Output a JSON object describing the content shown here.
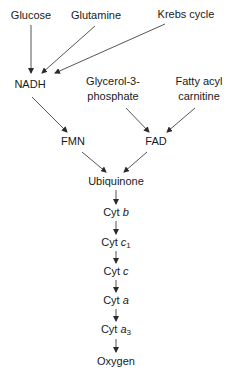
{
  "diagram": {
    "type": "flowchart",
    "title": "",
    "colors": {
      "line": "#2a2a2a",
      "text": "#1a1a1a",
      "background": "#ffffff"
    },
    "nodes": {
      "glucose": {
        "label": "Glucose"
      },
      "glutamine": {
        "label": "Glutamine"
      },
      "krebs": {
        "label": "Krebs cycle"
      },
      "nadh": {
        "label": "NADH"
      },
      "glycerol": {
        "line1": "Glycerol-3-",
        "line2": "phosphate"
      },
      "fatty": {
        "line1": "Fatty acyl",
        "line2": "carnitine"
      },
      "fmn": {
        "label": "FMN"
      },
      "fad": {
        "label": "FAD"
      },
      "ubiquinone": {
        "label": "Ubiquinone"
      },
      "cytb": {
        "prefix": "Cyt ",
        "letter": "b"
      },
      "cytc1": {
        "prefix": "Cyt ",
        "letter": "c",
        "sub": "1"
      },
      "cytc": {
        "prefix": "Cyt ",
        "letter": "c"
      },
      "cyta": {
        "prefix": "Cyt ",
        "letter": "a"
      },
      "cyta3": {
        "prefix": "Cyt ",
        "letter": "a",
        "sub": "3"
      },
      "oxygen": {
        "label": "Oxygen"
      }
    },
    "edges": [
      [
        "Glucose",
        "NADH"
      ],
      [
        "Glutamine",
        "NADH"
      ],
      [
        "Krebs cycle",
        "NADH"
      ],
      [
        "NADH",
        "FMN"
      ],
      [
        "Glycerol-3-phosphate",
        "FAD"
      ],
      [
        "Fatty acyl carnitine",
        "FAD"
      ],
      [
        "FMN",
        "Ubiquinone"
      ],
      [
        "FAD",
        "Ubiquinone"
      ],
      [
        "Ubiquinone",
        "Cyt b"
      ],
      [
        "Cyt b",
        "Cyt c1"
      ],
      [
        "Cyt c1",
        "Cyt c"
      ],
      [
        "Cyt c",
        "Cyt a"
      ],
      [
        "Cyt a",
        "Cyt a3"
      ],
      [
        "Cyt a3",
        "Oxygen"
      ]
    ]
  }
}
